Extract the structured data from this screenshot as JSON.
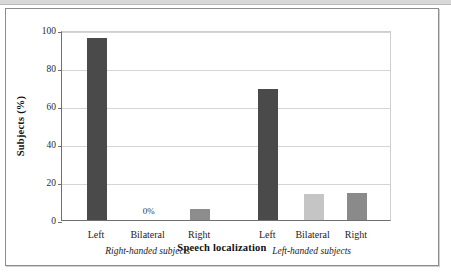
{
  "figure": {
    "background": "#ffffff",
    "frame_color": "#8d8d8d"
  },
  "chart_data": {
    "type": "bar",
    "title": "",
    "xlabel": "Speech localization",
    "ylabel": "Subjects (%)",
    "ylim": [
      0,
      100
    ],
    "yticks": [
      0,
      20,
      40,
      60,
      80,
      100
    ],
    "ytick_labels": [
      "0",
      "20",
      "40",
      "60",
      "80",
      "100"
    ],
    "grid": true,
    "legend": "none",
    "groups": [
      {
        "name": "Right-handed subjects",
        "categories": [
          "Left",
          "Bilateral",
          "Right"
        ],
        "values": [
          96,
          0,
          6
        ],
        "colors": [
          "#4a4a4a",
          "#c7c7c7",
          "#8d8d8d"
        ],
        "data_labels": [
          "",
          "0%",
          ""
        ]
      },
      {
        "name": "Left-handed subjects",
        "categories": [
          "Left",
          "Bilateral",
          "Right"
        ],
        "values": [
          69,
          13.5,
          14
        ],
        "colors": [
          "#4a4a4a",
          "#c5c5c5",
          "#8a8a8a"
        ],
        "data_labels": [
          "",
          "",
          ""
        ]
      }
    ],
    "categories": [
      "Left",
      "Bilateral",
      "Right",
      "Left",
      "Bilateral",
      "Right"
    ],
    "values": [
      96,
      0,
      6,
      69,
      13.5,
      14
    ],
    "series": [
      {
        "name": "Subjects (%)",
        "values": [
          96,
          0,
          6,
          69,
          13.5,
          14
        ]
      }
    ]
  }
}
